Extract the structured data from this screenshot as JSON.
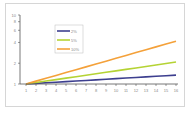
{
  "chart_data": {
    "type": "line",
    "title": "",
    "xlabel": "",
    "ylabel": "",
    "yscale": "log",
    "ylim": [
      1,
      10
    ],
    "y_ticks": [
      "1",
      "2",
      "4",
      "6",
      "8",
      "10"
    ],
    "y_tick_values": [
      1,
      2,
      4,
      6,
      8,
      10
    ],
    "x": [
      1,
      2,
      3,
      4,
      5,
      6,
      7,
      8,
      9,
      10,
      11,
      12,
      13,
      14,
      15,
      16
    ],
    "x_ticks": [
      "1",
      "2",
      "3",
      "4",
      "5",
      "6",
      "7",
      "8",
      "9",
      "10",
      "11",
      "12",
      "13",
      "14",
      "15",
      "16"
    ],
    "grid": false,
    "legend_position": "upper-left-inside",
    "series": [
      {
        "name": "2%",
        "color": "#3d3f8f",
        "values": [
          1.0,
          1.02,
          1.04,
          1.061,
          1.082,
          1.104,
          1.126,
          1.149,
          1.172,
          1.195,
          1.219,
          1.243,
          1.268,
          1.294,
          1.319,
          1.346
        ]
      },
      {
        "name": "5%",
        "color": "#b5d334",
        "values": [
          1.0,
          1.05,
          1.103,
          1.158,
          1.216,
          1.276,
          1.34,
          1.407,
          1.477,
          1.551,
          1.629,
          1.71,
          1.796,
          1.886,
          1.98,
          2.079
        ]
      },
      {
        "name": "10%",
        "color": "#f4a13a",
        "values": [
          1.0,
          1.1,
          1.21,
          1.331,
          1.464,
          1.611,
          1.772,
          1.949,
          2.144,
          2.358,
          2.594,
          2.853,
          3.138,
          3.452,
          3.797,
          4.177
        ]
      }
    ]
  }
}
